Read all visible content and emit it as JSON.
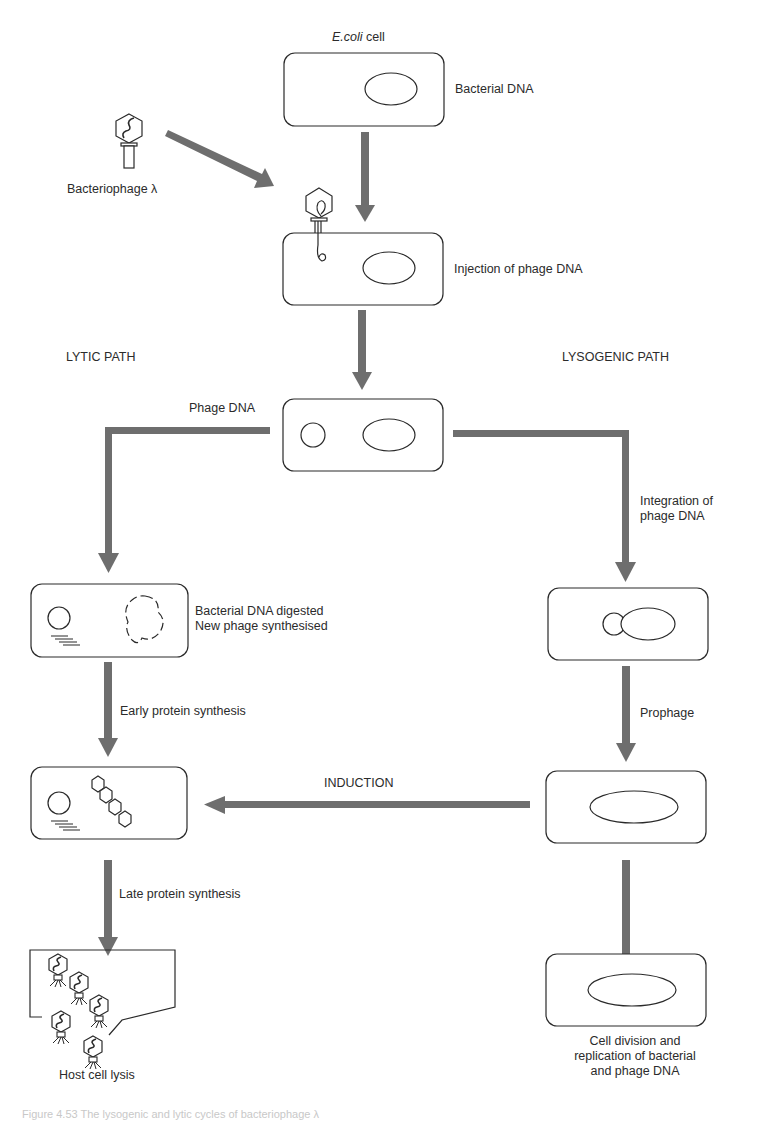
{
  "colors": {
    "arrow": "#6e6e6e",
    "outline": "#2a2a2a",
    "text": "#2b2b2b",
    "background": "#ffffff"
  },
  "labels": {
    "ecoli_cell_italic": "E.coli",
    "ecoli_cell_suffix": " cell",
    "bacterial_dna": "Bacterial DNA",
    "bacteriophage": "Bacteriophage λ",
    "injection": "Injection of phage DNA",
    "lytic_path": "LYTIC PATH",
    "lysogenic_path": "LYSOGENIC PATH",
    "phage_dna": "Phage DNA",
    "integration_line1": "Integration of",
    "integration_line2": "phage DNA",
    "digested_line1": "Bacterial DNA digested",
    "digested_line2": "New phage synthesised",
    "early_protein": "Early protein synthesis",
    "prophage": "Prophage",
    "induction": "INDUCTION",
    "late_protein": "Late protein synthesis",
    "host_lysis": "Host cell lysis",
    "division_line1": "Cell division and",
    "division_line2": "replication of bacterial",
    "division_line3": "and phage DNA"
  },
  "caption": "Figure 4.53  The lysogenic and lytic cycles of bacteriophage λ",
  "nodes": [
    {
      "id": "ecoli-cell",
      "label": "E.coli cell"
    },
    {
      "id": "injection-cell",
      "label": "Injection of phage DNA"
    },
    {
      "id": "phage-dna-cell",
      "label": "Phage DNA"
    },
    {
      "id": "digested-cell",
      "label": "Bacterial DNA digested / New phage synthesised"
    },
    {
      "id": "integration-cell",
      "label": "Integration of phage DNA"
    },
    {
      "id": "early-protein-cell",
      "label": "Early protein synthesis"
    },
    {
      "id": "prophage-cell",
      "label": "Prophage"
    },
    {
      "id": "lysis-cell",
      "label": "Host cell lysis"
    },
    {
      "id": "division-cell",
      "label": "Cell division and replication of bacterial and phage DNA"
    }
  ],
  "edges": [
    {
      "from": "bacteriophage",
      "to": "injection-cell"
    },
    {
      "from": "ecoli-cell",
      "to": "injection-cell"
    },
    {
      "from": "injection-cell",
      "to": "phage-dna-cell"
    },
    {
      "from": "phage-dna-cell",
      "to": "digested-cell",
      "path": "lytic"
    },
    {
      "from": "phage-dna-cell",
      "to": "integration-cell",
      "path": "lysogenic"
    },
    {
      "from": "digested-cell",
      "to": "early-protein-cell",
      "label": "Early protein synthesis"
    },
    {
      "from": "integration-cell",
      "to": "prophage-cell",
      "label": "Prophage"
    },
    {
      "from": "prophage-cell",
      "to": "early-protein-cell",
      "label": "INDUCTION"
    },
    {
      "from": "early-protein-cell",
      "to": "lysis-cell",
      "label": "Late protein synthesis"
    },
    {
      "from": "prophage-cell",
      "to": "division-cell"
    }
  ]
}
